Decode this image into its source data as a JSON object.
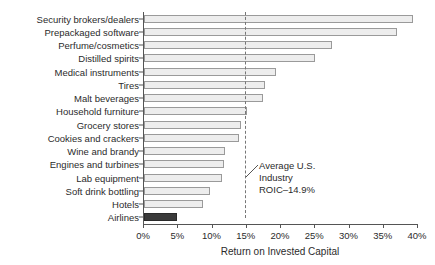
{
  "chart_data": {
    "type": "bar",
    "orientation": "horizontal",
    "title": "",
    "xlabel": "Return on Invested Capital",
    "ylabel": "",
    "xlim": [
      0,
      40
    ],
    "grid": false,
    "legend": "none",
    "categories": [
      "Security brokers/dealers",
      "Prepackaged software",
      "Perfume/cosmetics",
      "Distilled spirits",
      "Medical instruments",
      "Tires",
      "Malt beverages",
      "Household furniture",
      "Grocery stores",
      "Cookies and crackers",
      "Wine and brandy",
      "Engines and turbines",
      "Lab equipment",
      "Soft drink bottling",
      "Hotels",
      "Airlines"
    ],
    "values": [
      39.3,
      37.0,
      27.5,
      25.0,
      19.3,
      17.7,
      17.4,
      15.0,
      14.2,
      13.9,
      11.8,
      11.7,
      11.4,
      9.6,
      8.6,
      4.8
    ],
    "highlight_category": "Airlines",
    "tick_labels": [
      "0%",
      "5%",
      "10%",
      "15%",
      "20%",
      "25%",
      "30%",
      "35%",
      "40%"
    ],
    "tick_values": [
      0,
      5,
      10,
      15,
      20,
      25,
      30,
      35,
      40
    ],
    "reference_line": {
      "value": 14.9,
      "label_lines": [
        "Average U.S.",
        "Industry",
        "ROIC–14.9%"
      ]
    },
    "colors": {
      "bar_fill": "#ededed",
      "bar_border": "#9a9a9a",
      "highlight_fill": "#3a3a3a",
      "axis": "#555555",
      "text": "#2b2b2b",
      "reference_line": "#777777"
    }
  }
}
